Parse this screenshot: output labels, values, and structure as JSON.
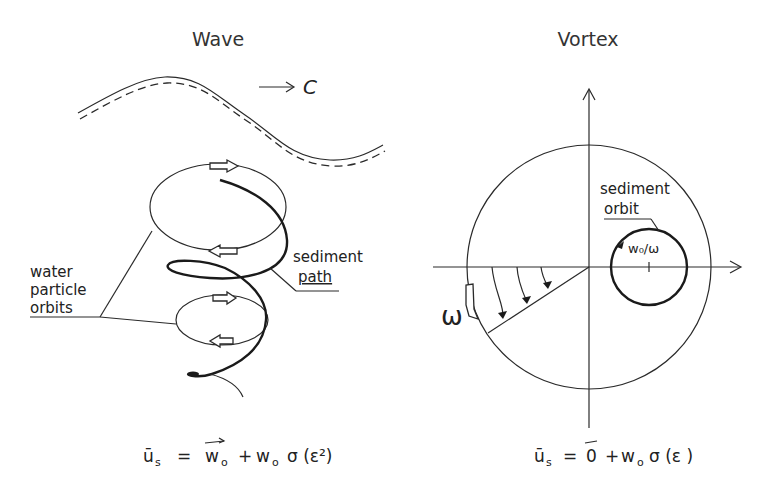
{
  "panels": {
    "wave": {
      "title": "Wave",
      "celerity_label": "C",
      "water_label_lines": [
        "water",
        "particle",
        "orbits"
      ],
      "sediment_label_lines": [
        "sediment",
        "path"
      ],
      "equation": {
        "lhs": "ū",
        "lhs_sub": "s",
        "equals": "=",
        "term1": "w",
        "term1_sub": "o",
        "plus": "+",
        "term2": "w",
        "term2_sub": "o",
        "order": "σ (ε²)"
      }
    },
    "vortex": {
      "title": "Vortex",
      "sediment_label_lines": [
        "sediment",
        "orbit"
      ],
      "radius_label": "w₀/ω",
      "omega_label": "ω",
      "equation": {
        "lhs": "ū",
        "lhs_sub": "s",
        "equals": "=",
        "term1": "0",
        "plus": "+",
        "term2": "w",
        "term2_sub": "o",
        "order": "σ (ε )"
      }
    }
  },
  "colors": {
    "ink": "#222222",
    "background": "#ffffff"
  }
}
